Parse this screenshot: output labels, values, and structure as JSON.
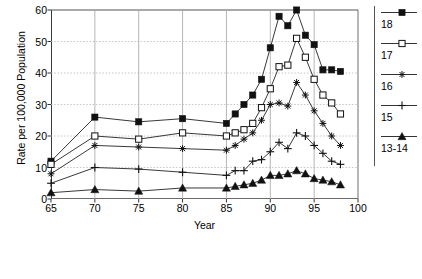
{
  "chart_data": {
    "type": "line",
    "title": "",
    "xlabel": "Year",
    "ylabel": "Rate per 100,000 Population",
    "xlim": [
      65,
      100
    ],
    "ylim": [
      0,
      60
    ],
    "xticks": [
      65,
      70,
      75,
      80,
      85,
      90,
      95,
      100
    ],
    "yticks": [
      0,
      10,
      20,
      30,
      40,
      50,
      60
    ],
    "grid": true,
    "legend_position": "right",
    "series": [
      {
        "name": "18",
        "marker": "filled-square",
        "x": [
          65,
          70,
          75,
          80,
          85,
          86,
          87,
          88,
          89,
          90,
          91,
          92,
          93,
          94,
          95,
          96,
          97,
          98
        ],
        "values": [
          12,
          26,
          24.5,
          25.5,
          24,
          27,
          30,
          33,
          38,
          48,
          58,
          55,
          60,
          52,
          49,
          41,
          41,
          40.5
        ]
      },
      {
        "name": "17",
        "marker": "open-square",
        "x": [
          65,
          70,
          75,
          80,
          85,
          86,
          87,
          88,
          89,
          90,
          91,
          92,
          93,
          94,
          95,
          96,
          97,
          98
        ],
        "values": [
          11,
          20,
          19,
          21,
          20,
          21,
          22,
          24,
          29,
          35,
          42,
          42.5,
          51,
          45,
          38,
          33,
          30.5,
          27
        ]
      },
      {
        "name": "16",
        "marker": "asterisk",
        "x": [
          65,
          70,
          75,
          80,
          85,
          86,
          87,
          88,
          89,
          90,
          91,
          92,
          93,
          94,
          95,
          96,
          97,
          98
        ],
        "values": [
          8,
          17,
          16.5,
          16,
          15.5,
          17,
          19,
          21,
          25,
          30,
          30.5,
          29.5,
          37,
          33,
          28,
          24,
          20,
          17
        ]
      },
      {
        "name": "15",
        "marker": "plus",
        "x": [
          65,
          70,
          75,
          80,
          85,
          86,
          87,
          88,
          89,
          90,
          91,
          92,
          93,
          94,
          95,
          96,
          97,
          98
        ],
        "values": [
          5,
          10,
          9.5,
          8.5,
          7.5,
          9,
          9,
          12,
          12.5,
          15,
          18,
          16,
          21,
          20,
          17,
          14.5,
          12,
          11
        ]
      },
      {
        "name": "13-14",
        "marker": "filled-triangle",
        "x": [
          65,
          70,
          75,
          80,
          85,
          86,
          87,
          88,
          89,
          90,
          91,
          92,
          93,
          94,
          95,
          96,
          97,
          98
        ],
        "values": [
          2,
          3,
          2.5,
          3.5,
          3.5,
          4,
          4.5,
          5,
          6,
          7.5,
          7.5,
          8,
          9,
          8,
          6.5,
          6,
          5.5,
          4.5
        ]
      }
    ]
  },
  "legend": {
    "items": [
      {
        "label": "18",
        "marker": "filled-square"
      },
      {
        "label": "17",
        "marker": "open-square"
      },
      {
        "label": "16",
        "marker": "asterisk"
      },
      {
        "label": "15",
        "marker": "plus"
      },
      {
        "label": "13-14",
        "marker": "filled-triangle"
      }
    ]
  }
}
